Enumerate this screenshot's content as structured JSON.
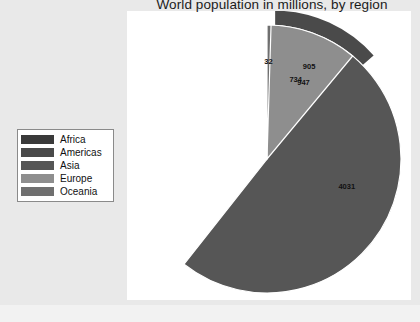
{
  "chart_data": {
    "type": "pie",
    "title": "World population in millions, by region",
    "xlabel": "",
    "ylabel": "",
    "categories": [
      "Africa",
      "Americas",
      "Asia",
      "Europe",
      "Oceania"
    ],
    "values": [
      947,
      905,
      4031,
      734,
      32
    ],
    "labels": [
      "947",
      "905",
      "4031",
      "734",
      "32"
    ],
    "total": 6649,
    "exploded_slice": "Americas",
    "start_angle_deg": 0,
    "direction": "clockwise",
    "legend_position": "left",
    "grid": false,
    "colors": [
      "#3a3a3a",
      "#4a4a4a",
      "#565656",
      "#8e8e8e",
      "#6f6f6f"
    ],
    "slices": [
      {
        "name": "Africa",
        "value": 947,
        "label": "947",
        "color": "#3a3a3a",
        "exploded": false
      },
      {
        "name": "Americas",
        "value": 905,
        "label": "905",
        "color": "#4a4a4a",
        "exploded": true
      },
      {
        "name": "Asia",
        "value": 4031,
        "label": "4031",
        "color": "#565656",
        "exploded": false
      },
      {
        "name": "Europe",
        "value": 734,
        "label": "734",
        "color": "#8e8e8e",
        "exploded": false
      },
      {
        "name": "Oceania",
        "value": 32,
        "label": "32",
        "color": "#6f6f6f",
        "exploded": false
      }
    ]
  },
  "legend": {
    "items": [
      {
        "label": "Africa",
        "color": "#3a3a3a"
      },
      {
        "label": "Americas",
        "color": "#4a4a4a"
      },
      {
        "label": "Asia",
        "color": "#565656"
      },
      {
        "label": "Europe",
        "color": "#8e8e8e"
      },
      {
        "label": "Oceania",
        "color": "#6f6f6f"
      }
    ]
  },
  "style": {
    "panel_background": "#ffffff",
    "figure_background": "#e9e9e9",
    "slice_separator": "#ffffff",
    "text_color": "#111111"
  }
}
